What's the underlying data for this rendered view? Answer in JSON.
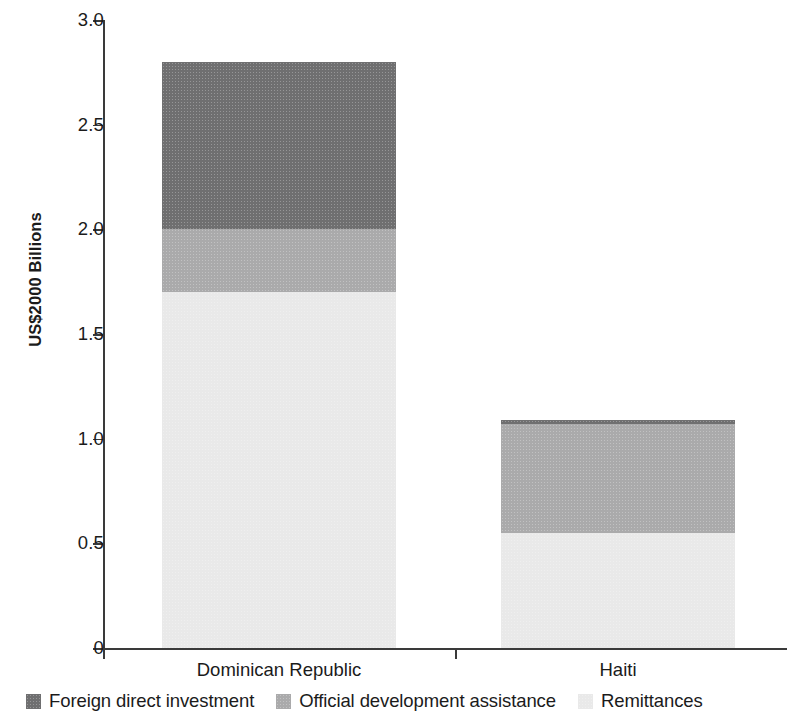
{
  "chart_data": {
    "type": "bar",
    "subtype": "stacked-vertical",
    "title": "",
    "subtitle": "",
    "xlabel": "",
    "ylabel": "US$2000 Billions",
    "categories": [
      "Dominican Republic",
      "Haiti"
    ],
    "series": [
      {
        "name": "Foreign direct investment",
        "values": [
          0.8,
          0.02
        ],
        "color": "#6f6f70"
      },
      {
        "name": "Official development assistance",
        "values": [
          0.3,
          0.52
        ],
        "color": "#aaaaab"
      },
      {
        "name": "Remittances",
        "values": [
          1.7,
          0.55
        ],
        "color": "#e9e9e9"
      }
    ],
    "stack_order_bottom_to_top": [
      "Remittances",
      "Official development assistance",
      "Foreign direct investment"
    ],
    "totals": [
      2.8,
      1.09
    ],
    "ylim": [
      0,
      3.0
    ],
    "ytick_labels": [
      "3.0",
      "2.5",
      "2.0",
      "1.5",
      "1.0",
      "0.5",
      "0"
    ],
    "ytick_values": [
      3.0,
      2.5,
      2.0,
      1.5,
      1.0,
      0.5,
      0
    ],
    "grid": false,
    "legend_position": "bottom"
  },
  "axes": {
    "y_title": "US$2000 Billions",
    "ticks": [
      {
        "label": "3.0",
        "value": 3.0
      },
      {
        "label": "2.5",
        "value": 2.5
      },
      {
        "label": "2.0",
        "value": 2.0
      },
      {
        "label": "1.5",
        "value": 1.5
      },
      {
        "label": "1.0",
        "value": 1.0
      },
      {
        "label": "0.5",
        "value": 0.5
      },
      {
        "label": "0",
        "value": 0
      }
    ]
  },
  "categories": [
    {
      "label": "Dominican Republic"
    },
    {
      "label": "Haiti"
    }
  ],
  "legend": {
    "items": [
      {
        "label": "Foreign direct investment",
        "color": "#6f6f70"
      },
      {
        "label": "Official development assistance",
        "color": "#aaaaab"
      },
      {
        "label": "Remittances",
        "color": "#e9e9e9"
      }
    ]
  }
}
